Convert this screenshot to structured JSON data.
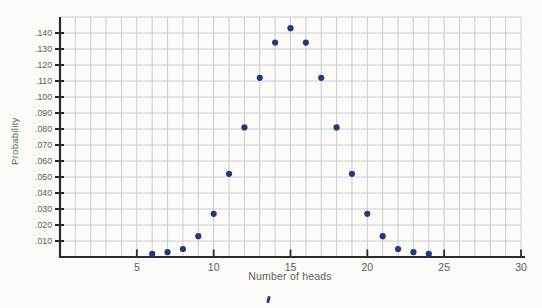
{
  "figure": {
    "background": "#fcfbf8"
  },
  "chart_data": {
    "type": "scatter",
    "title": "",
    "xlabel": "Number of heads",
    "ylabel": "Probability",
    "xlim": [
      0,
      30
    ],
    "ylim": [
      0,
      0.15
    ],
    "grid": true,
    "x_minor_grid_step": 1,
    "y_grid_step": 0.01,
    "x_major_ticks": [
      5,
      10,
      15,
      20,
      25,
      30
    ],
    "y_tick_labels": [
      ".010",
      ".020",
      ".030",
      ".040",
      ".050",
      ".060",
      ".070",
      ".080",
      ".090",
      ".100",
      ".110",
      ".120",
      ".130",
      ".140"
    ],
    "points": [
      {
        "x": 6,
        "y": 0.002
      },
      {
        "x": 7,
        "y": 0.003
      },
      {
        "x": 8,
        "y": 0.005
      },
      {
        "x": 9,
        "y": 0.013
      },
      {
        "x": 10,
        "y": 0.027
      },
      {
        "x": 11,
        "y": 0.052
      },
      {
        "x": 12,
        "y": 0.081
      },
      {
        "x": 13,
        "y": 0.112
      },
      {
        "x": 14,
        "y": 0.134
      },
      {
        "x": 15,
        "y": 0.143
      },
      {
        "x": 16,
        "y": 0.134
      },
      {
        "x": 17,
        "y": 0.112
      },
      {
        "x": 18,
        "y": 0.081
      },
      {
        "x": 19,
        "y": 0.052
      },
      {
        "x": 20,
        "y": 0.027
      },
      {
        "x": 21,
        "y": 0.013
      },
      {
        "x": 22,
        "y": 0.005
      },
      {
        "x": 23,
        "y": 0.003
      },
      {
        "x": 24,
        "y": 0.002
      }
    ],
    "colors": {
      "point": "#1f3a80",
      "grid": "#c3c8ce",
      "axis": "#2b2b2b",
      "tick_text": "#5a5a5a"
    },
    "legend": null
  },
  "artifacts": {
    "partial_caption_mark_color": "#2a3c85"
  }
}
